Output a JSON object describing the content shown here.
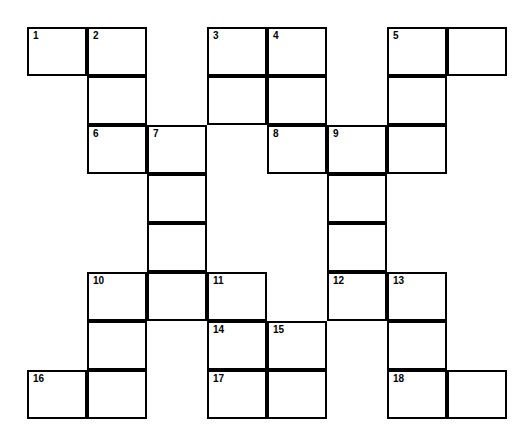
{
  "puzzle": {
    "title": "Crossword Puzzle Grid",
    "grid_columns": 8,
    "grid_rows": 8,
    "cell_width": 60,
    "cell_height": 49,
    "origin_x": 27,
    "origin_y": 27,
    "border_color": "#000000",
    "cell_fill_color": "#ffffff",
    "background_color": "#ffffff",
    "border_width_px": 2.5,
    "number_font_size_px": 10,
    "total_cells": 34,
    "numbered_cell_count": 18,
    "cells": [
      {
        "row": 1,
        "col": 1,
        "number": "1",
        "entry": ""
      },
      {
        "row": 1,
        "col": 2,
        "number": "2",
        "entry": ""
      },
      {
        "row": 1,
        "col": 4,
        "number": "3",
        "entry": ""
      },
      {
        "row": 1,
        "col": 5,
        "number": "4",
        "entry": ""
      },
      {
        "row": 1,
        "col": 7,
        "number": "5",
        "entry": ""
      },
      {
        "row": 1,
        "col": 8,
        "number": "",
        "entry": ""
      },
      {
        "row": 2,
        "col": 2,
        "number": "",
        "entry": ""
      },
      {
        "row": 2,
        "col": 4,
        "number": "",
        "entry": ""
      },
      {
        "row": 2,
        "col": 5,
        "number": "",
        "entry": ""
      },
      {
        "row": 2,
        "col": 7,
        "number": "",
        "entry": ""
      },
      {
        "row": 3,
        "col": 2,
        "number": "6",
        "entry": ""
      },
      {
        "row": 3,
        "col": 3,
        "number": "7",
        "entry": ""
      },
      {
        "row": 3,
        "col": 5,
        "number": "8",
        "entry": ""
      },
      {
        "row": 3,
        "col": 6,
        "number": "9",
        "entry": ""
      },
      {
        "row": 3,
        "col": 7,
        "number": "",
        "entry": ""
      },
      {
        "row": 4,
        "col": 3,
        "number": "",
        "entry": ""
      },
      {
        "row": 4,
        "col": 6,
        "number": "",
        "entry": ""
      },
      {
        "row": 5,
        "col": 3,
        "number": "",
        "entry": ""
      },
      {
        "row": 5,
        "col": 6,
        "number": "",
        "entry": ""
      },
      {
        "row": 6,
        "col": 2,
        "number": "10",
        "entry": ""
      },
      {
        "row": 6,
        "col": 3,
        "number": "",
        "entry": ""
      },
      {
        "row": 6,
        "col": 4,
        "number": "11",
        "entry": ""
      },
      {
        "row": 6,
        "col": 6,
        "number": "12",
        "entry": ""
      },
      {
        "row": 6,
        "col": 7,
        "number": "13",
        "entry": ""
      },
      {
        "row": 7,
        "col": 2,
        "number": "",
        "entry": ""
      },
      {
        "row": 7,
        "col": 4,
        "number": "14",
        "entry": ""
      },
      {
        "row": 7,
        "col": 5,
        "number": "15",
        "entry": ""
      },
      {
        "row": 7,
        "col": 7,
        "number": "",
        "entry": ""
      },
      {
        "row": 8,
        "col": 1,
        "number": "16",
        "entry": ""
      },
      {
        "row": 8,
        "col": 2,
        "number": "",
        "entry": ""
      },
      {
        "row": 8,
        "col": 4,
        "number": "17",
        "entry": ""
      },
      {
        "row": 8,
        "col": 5,
        "number": "",
        "entry": ""
      },
      {
        "row": 8,
        "col": 7,
        "number": "18",
        "entry": ""
      },
      {
        "row": 8,
        "col": 8,
        "number": "",
        "entry": ""
      }
    ],
    "clue_numbers": [
      "1",
      "2",
      "3",
      "4",
      "5",
      "6",
      "7",
      "8",
      "9",
      "10",
      "11",
      "12",
      "13",
      "14",
      "15",
      "16",
      "17",
      "18"
    ]
  }
}
